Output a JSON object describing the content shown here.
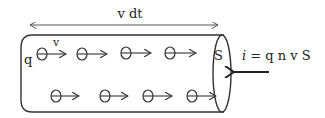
{
  "diagram": {
    "length_label": "v dt",
    "charge_label": "q",
    "velocity_label": "v",
    "area_label": "S",
    "current_formula": {
      "italic_var": "i",
      "rest": " = q n v S"
    },
    "electron_symbol": "⊖",
    "top_row_electrons": 4,
    "bottom_row_electrons": 4,
    "colors": {
      "stroke": "#333333",
      "text": "#222222",
      "background": "#ffffff"
    }
  }
}
